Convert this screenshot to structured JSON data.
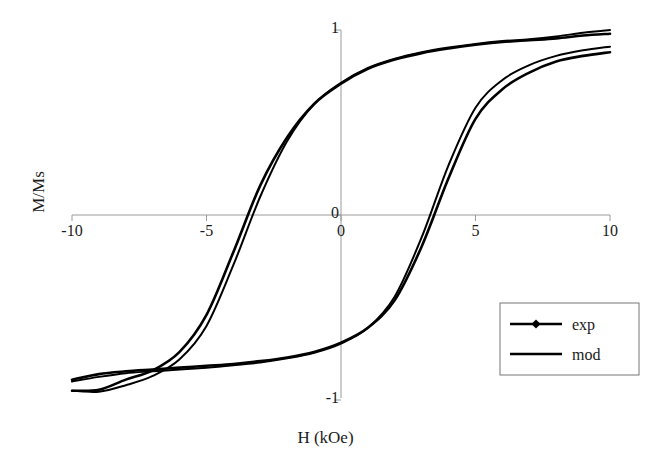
{
  "chart_data": {
    "type": "line",
    "title": "",
    "xlabel": "H (kOe)",
    "ylabel": "M/Ms",
    "xlim": [
      -10,
      10
    ],
    "ylim": [
      -1,
      1
    ],
    "xticks": [
      -10,
      -5,
      0,
      5,
      10
    ],
    "xtick_labels": [
      "-10",
      "-5",
      "0",
      "5",
      "10"
    ],
    "yticks": [
      1,
      0,
      -1
    ],
    "ytick_labels": [
      "1",
      "0",
      "-1"
    ],
    "grid": false,
    "legend_position": "lower right",
    "legend_entries": [
      "exp",
      "mod"
    ],
    "axes_style": "zero-crossing spines",
    "marker": "filled-diamond",
    "line_color": "#000000",
    "series": [
      {
        "name": "exp",
        "branch": "descending",
        "marker": "diamond",
        "x": [
          10,
          9,
          8,
          7,
          6,
          5,
          4,
          3,
          2,
          1,
          0,
          -1,
          -2,
          -3,
          -4,
          -5,
          -6,
          -7,
          -8,
          -9,
          -10
        ],
        "y": [
          0.98,
          0.97,
          0.955,
          0.945,
          0.935,
          0.92,
          0.9,
          0.875,
          0.84,
          0.79,
          0.71,
          0.6,
          0.42,
          0.16,
          -0.2,
          -0.54,
          -0.74,
          -0.84,
          -0.89,
          -0.945,
          -0.95
        ]
      },
      {
        "name": "exp",
        "branch": "ascending",
        "marker": "diamond",
        "x": [
          -10,
          -9,
          -8,
          -7,
          -6,
          -5,
          -4,
          -3,
          -2,
          -1,
          0,
          1,
          2,
          3,
          4,
          5,
          6,
          7,
          8,
          9,
          10
        ],
        "y": [
          -0.89,
          -0.86,
          -0.845,
          -0.835,
          -0.825,
          -0.815,
          -0.805,
          -0.79,
          -0.77,
          -0.74,
          -0.69,
          -0.61,
          -0.46,
          -0.17,
          0.2,
          0.52,
          0.68,
          0.77,
          0.83,
          0.86,
          0.88
        ]
      },
      {
        "name": "mod",
        "branch": "descending",
        "marker": "none",
        "x": [
          10,
          9,
          8,
          7,
          6,
          5,
          4,
          3,
          2,
          1,
          0,
          -1,
          -2,
          -3,
          -4,
          -5,
          -6,
          -7,
          -8,
          -9,
          -10
        ],
        "y": [
          1.0,
          0.985,
          0.965,
          0.95,
          0.94,
          0.925,
          0.905,
          0.88,
          0.845,
          0.795,
          0.715,
          0.6,
          0.4,
          0.1,
          -0.27,
          -0.6,
          -0.78,
          -0.87,
          -0.92,
          -0.955,
          -0.95
        ]
      },
      {
        "name": "mod",
        "branch": "ascending",
        "marker": "none",
        "x": [
          -10,
          -9,
          -8,
          -7,
          -6,
          -5,
          -4,
          -3,
          -2,
          -1,
          0,
          1,
          2,
          3,
          4,
          5,
          6,
          7,
          8,
          9,
          10
        ],
        "y": [
          -0.9,
          -0.875,
          -0.855,
          -0.845,
          -0.835,
          -0.825,
          -0.812,
          -0.797,
          -0.775,
          -0.745,
          -0.695,
          -0.61,
          -0.44,
          -0.12,
          0.27,
          0.58,
          0.73,
          0.81,
          0.86,
          0.89,
          0.91
        ]
      }
    ],
    "coercivity": {
      "descending_zero_crossing": -3.6,
      "ascending_zero_crossing": 3.5
    }
  },
  "legend": {
    "items": [
      {
        "label": "exp",
        "marker": "diamond",
        "line": true
      },
      {
        "label": "mod",
        "marker": "none",
        "line": true
      }
    ]
  }
}
